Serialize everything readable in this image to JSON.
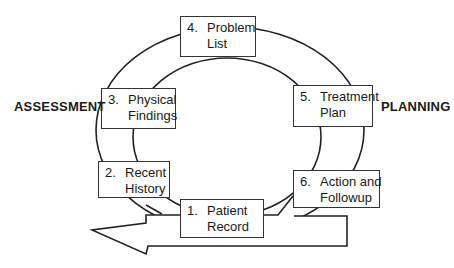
{
  "diagram": {
    "type": "cycle",
    "side_labels": {
      "left": "ASSESSMENT",
      "right": "PLANNING"
    },
    "steps": [
      {
        "number": "1.",
        "line1": "Patient",
        "line2": "Record"
      },
      {
        "number": "2.",
        "line1": "Recent",
        "line2": "History"
      },
      {
        "number": "3.",
        "line1": "Physical",
        "line2": "Findings"
      },
      {
        "number": "4.",
        "line1": "Problem",
        "line2": "List"
      },
      {
        "number": "5.",
        "line1": "Treatment",
        "line2": "Plan"
      },
      {
        "number": "6.",
        "line1": "Action and",
        "line2": "Followup"
      }
    ],
    "colors": {
      "line": "#222222",
      "background": "#ffffff"
    }
  }
}
